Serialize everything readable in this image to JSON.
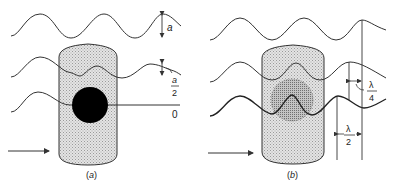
{
  "figure": {
    "panel_a": {
      "caption": "(a)",
      "amplitude_labels": {
        "full": "a",
        "half_num": "a",
        "half_den": "2",
        "zero": "0"
      },
      "object": "amplitude object (opaque disc)"
    },
    "panel_b": {
      "caption": "(b)",
      "phase_labels": {
        "quarter_num": "λ",
        "quarter_den": "4",
        "half_num": "λ",
        "half_den": "2"
      },
      "object": "phase object (retarding disc)"
    },
    "colors": {
      "line": "#333333",
      "cylinder_fill": "#d9d9d9",
      "disc_black": "#000000",
      "disc_phase": "#b8b8b8"
    }
  }
}
